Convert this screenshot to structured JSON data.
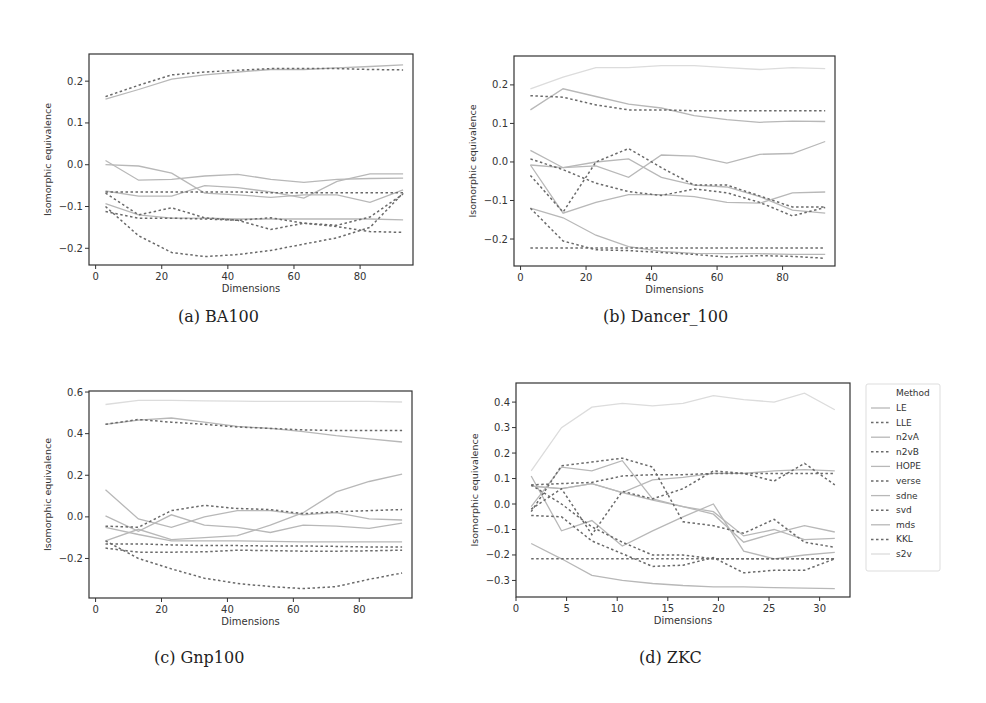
{
  "figure": {
    "subplots": [
      {
        "id": "a",
        "caption": "(a) BA100"
      },
      {
        "id": "b",
        "caption": "(b) Dancer_100"
      },
      {
        "id": "c",
        "caption": "(c) Gnp100"
      },
      {
        "id": "d",
        "caption": "(d) ZKC"
      }
    ],
    "legend": {
      "title": "Method",
      "entries": [
        {
          "label": "LE",
          "style": "solid"
        },
        {
          "label": "LLE",
          "style": "dashed"
        },
        {
          "label": "n2vA",
          "style": "solid"
        },
        {
          "label": "n2vB",
          "style": "dashed"
        },
        {
          "label": "HOPE",
          "style": "solid"
        },
        {
          "label": "verse",
          "style": "dashed"
        },
        {
          "label": "sdne",
          "style": "solid"
        },
        {
          "label": "svd",
          "style": "dashed"
        },
        {
          "label": "mds",
          "style": "solid"
        },
        {
          "label": "KKL",
          "style": "dashed"
        },
        {
          "label": "s2v",
          "style": "solid"
        }
      ]
    },
    "colors": {
      "solid_line": "#b8b8b8",
      "dashed_line": "#6a6a6a",
      "faint_line": "#dcdcdc",
      "axis": "#333333"
    }
  },
  "chart_data": [
    {
      "type": "line",
      "title": "(a) BA100",
      "xlabel": "Dimensions",
      "ylabel": "Isomorphic equivalence",
      "xlim": [
        -2,
        96
      ],
      "ylim": [
        -0.24,
        0.265
      ],
      "xticks": [
        0,
        20,
        40,
        60,
        80
      ],
      "yticks": [
        -0.2,
        -0.1,
        0.0,
        0.1,
        0.2
      ],
      "ytick_labels": [
        "−0.2",
        "−0.1",
        "0.0",
        "0.1",
        "0.2"
      ],
      "grid": false,
      "x": [
        3,
        13,
        23,
        33,
        43,
        53,
        63,
        73,
        83,
        93
      ],
      "series": [
        {
          "name": "s-top",
          "style": "solid",
          "values": [
            0.157,
            0.18,
            0.205,
            0.215,
            0.222,
            0.228,
            0.228,
            0.232,
            0.235,
            0.239
          ]
        },
        {
          "name": "d-top",
          "style": "dashed",
          "values": [
            0.163,
            0.19,
            0.215,
            0.222,
            0.226,
            0.23,
            0.23,
            0.23,
            0.228,
            0.227
          ]
        },
        {
          "name": "s1",
          "style": "solid",
          "values": [
            0.0,
            -0.003,
            -0.02,
            -0.068,
            -0.072,
            -0.078,
            -0.072,
            -0.072,
            -0.09,
            -0.06
          ]
        },
        {
          "name": "s2",
          "style": "solid",
          "values": [
            0.01,
            -0.037,
            -0.035,
            -0.027,
            -0.023,
            -0.035,
            -0.042,
            -0.035,
            -0.033,
            -0.032
          ]
        },
        {
          "name": "s3",
          "style": "solid",
          "values": [
            -0.063,
            -0.075,
            -0.075,
            -0.05,
            -0.055,
            -0.065,
            -0.08,
            -0.04,
            -0.022,
            -0.022
          ]
        },
        {
          "name": "s4",
          "style": "solid",
          "values": [
            -0.093,
            -0.12,
            -0.128,
            -0.128,
            -0.13,
            -0.13,
            -0.13,
            -0.13,
            -0.13,
            -0.132
          ]
        },
        {
          "name": "d1",
          "style": "dashed",
          "values": [
            -0.065,
            -0.065,
            -0.065,
            -0.065,
            -0.065,
            -0.067,
            -0.067,
            -0.067,
            -0.067,
            -0.067
          ]
        },
        {
          "name": "d2",
          "style": "dashed",
          "values": [
            -0.068,
            -0.12,
            -0.103,
            -0.127,
            -0.133,
            -0.155,
            -0.14,
            -0.145,
            -0.125,
            -0.07
          ]
        },
        {
          "name": "d3",
          "style": "dashed",
          "values": [
            -0.112,
            -0.128,
            -0.128,
            -0.13,
            -0.133,
            -0.127,
            -0.14,
            -0.148,
            -0.16,
            -0.162
          ]
        },
        {
          "name": "d4",
          "style": "dashed",
          "values": [
            -0.1,
            -0.17,
            -0.21,
            -0.22,
            -0.215,
            -0.205,
            -0.19,
            -0.175,
            -0.15,
            -0.068
          ]
        }
      ]
    },
    {
      "type": "line",
      "title": "(b) Dancer_100",
      "xlabel": "Dimensions",
      "ylabel": "Isomorphic equivalence",
      "xlim": [
        -2,
        96
      ],
      "ylim": [
        -0.27,
        0.275
      ],
      "xticks": [
        0,
        20,
        40,
        60,
        80
      ],
      "yticks": [
        -0.2,
        -0.1,
        0.0,
        0.1,
        0.2
      ],
      "ytick_labels": [
        "−0.2",
        "−0.1",
        "0.0",
        "0.1",
        "0.2"
      ],
      "grid": false,
      "x": [
        3,
        13,
        23,
        33,
        43,
        53,
        63,
        73,
        83,
        93
      ],
      "series": [
        {
          "name": "faint-top",
          "style": "faint",
          "values": [
            0.19,
            0.22,
            0.245,
            0.245,
            0.25,
            0.25,
            0.245,
            0.24,
            0.245,
            0.242
          ]
        },
        {
          "name": "s-top",
          "style": "solid",
          "values": [
            0.135,
            0.19,
            0.17,
            0.15,
            0.14,
            0.12,
            0.11,
            0.103,
            0.106,
            0.105
          ]
        },
        {
          "name": "d-top",
          "style": "dashed",
          "values": [
            0.172,
            0.168,
            0.148,
            0.135,
            0.135,
            0.133,
            0.133,
            0.133,
            0.133,
            0.133
          ]
        },
        {
          "name": "s1",
          "style": "solid",
          "values": [
            -0.008,
            -0.015,
            0.0,
            0.008,
            -0.04,
            -0.06,
            -0.065,
            -0.09,
            -0.125,
            -0.133
          ]
        },
        {
          "name": "s2",
          "style": "solid",
          "values": [
            0.03,
            -0.015,
            -0.01,
            -0.04,
            0.018,
            0.015,
            -0.003,
            0.02,
            0.022,
            0.053
          ]
        },
        {
          "name": "s3",
          "style": "solid",
          "values": [
            -0.008,
            -0.133,
            -0.105,
            -0.085,
            -0.085,
            -0.09,
            -0.105,
            -0.107,
            -0.08,
            -0.078
          ]
        },
        {
          "name": "s4",
          "style": "solid",
          "values": [
            -0.12,
            -0.145,
            -0.19,
            -0.22,
            -0.232,
            -0.237,
            -0.238,
            -0.238,
            -0.24,
            -0.24
          ]
        },
        {
          "name": "d1",
          "style": "dashed",
          "values": [
            0.008,
            -0.02,
            -0.055,
            -0.077,
            -0.087,
            -0.07,
            -0.08,
            -0.105,
            -0.14,
            -0.118
          ]
        },
        {
          "name": "d2",
          "style": "dashed",
          "values": [
            -0.035,
            -0.13,
            0.0,
            0.035,
            -0.015,
            -0.06,
            -0.06,
            -0.088,
            -0.117,
            -0.117
          ]
        },
        {
          "name": "d3",
          "style": "dashed",
          "values": [
            -0.12,
            -0.205,
            -0.228,
            -0.23,
            -0.235,
            -0.24,
            -0.247,
            -0.243,
            -0.245,
            -0.25
          ]
        },
        {
          "name": "d4",
          "style": "dashed",
          "values": [
            -0.223,
            -0.223,
            -0.223,
            -0.223,
            -0.223,
            -0.223,
            -0.223,
            -0.223,
            -0.223,
            -0.223
          ]
        }
      ]
    },
    {
      "type": "line",
      "title": "(c) Gnp100",
      "xlabel": "Dimensions",
      "ylabel": "Isomorphic equivalence",
      "xlim": [
        -2,
        96
      ],
      "ylim": [
        -0.39,
        0.605
      ],
      "xticks": [
        0,
        20,
        40,
        60,
        80
      ],
      "yticks": [
        -0.2,
        0.0,
        0.2,
        0.4,
        0.6
      ],
      "ytick_labels": [
        "−0.2",
        "0.0",
        "0.2",
        "0.4",
        "0.6"
      ],
      "grid": false,
      "x": [
        3,
        13,
        23,
        33,
        43,
        53,
        63,
        73,
        83,
        93
      ],
      "series": [
        {
          "name": "faint-top",
          "style": "faint",
          "values": [
            0.54,
            0.56,
            0.56,
            0.558,
            0.556,
            0.555,
            0.555,
            0.555,
            0.555,
            0.552
          ]
        },
        {
          "name": "s-top",
          "style": "solid",
          "values": [
            0.445,
            0.465,
            0.475,
            0.455,
            0.435,
            0.425,
            0.41,
            0.39,
            0.375,
            0.36
          ]
        },
        {
          "name": "d-top",
          "style": "dashed",
          "values": [
            0.445,
            0.468,
            0.455,
            0.445,
            0.432,
            0.425,
            0.418,
            0.415,
            0.415,
            0.415
          ]
        },
        {
          "name": "s1",
          "style": "solid",
          "values": [
            0.13,
            -0.01,
            -0.05,
            0.0,
            0.03,
            0.03,
            0.01,
            0.02,
            -0.01,
            -0.015
          ]
        },
        {
          "name": "s2",
          "style": "solid",
          "values": [
            0.005,
            -0.07,
            0.01,
            -0.04,
            -0.05,
            -0.075,
            -0.04,
            -0.045,
            -0.055,
            -0.03
          ]
        },
        {
          "name": "s3",
          "style": "solid",
          "values": [
            -0.115,
            -0.06,
            -0.11,
            -0.1,
            -0.09,
            -0.04,
            0.02,
            0.12,
            0.17,
            0.205
          ]
        },
        {
          "name": "s4",
          "style": "solid",
          "values": [
            -0.05,
            -0.085,
            -0.115,
            -0.115,
            -0.115,
            -0.118,
            -0.12,
            -0.12,
            -0.12,
            -0.12
          ]
        },
        {
          "name": "d1",
          "style": "dashed",
          "values": [
            -0.045,
            -0.05,
            0.03,
            0.055,
            0.04,
            0.035,
            0.015,
            0.025,
            0.03,
            0.035
          ]
        },
        {
          "name": "d2",
          "style": "dashed",
          "values": [
            -0.13,
            -0.13,
            -0.135,
            -0.138,
            -0.138,
            -0.14,
            -0.14,
            -0.142,
            -0.145,
            -0.145
          ]
        },
        {
          "name": "d3",
          "style": "dashed",
          "values": [
            -0.15,
            -0.17,
            -0.17,
            -0.168,
            -0.16,
            -0.162,
            -0.165,
            -0.165,
            -0.163,
            -0.16
          ]
        },
        {
          "name": "d4",
          "style": "dashed",
          "values": [
            -0.115,
            -0.2,
            -0.25,
            -0.295,
            -0.32,
            -0.335,
            -0.345,
            -0.335,
            -0.3,
            -0.27
          ]
        }
      ]
    },
    {
      "type": "line",
      "title": "(d) ZKC",
      "xlabel": "Dimensions",
      "ylabel": "Isomorphic equivalence",
      "xlim": [
        0,
        33
      ],
      "ylim": [
        -0.365,
        0.475
      ],
      "xticks": [
        0,
        5,
        10,
        15,
        20,
        25,
        30
      ],
      "yticks": [
        -0.3,
        -0.2,
        -0.1,
        0.0,
        0.1,
        0.2,
        0.3,
        0.4
      ],
      "ytick_labels": [
        "−0.3",
        "−0.2",
        "−0.1",
        "0.0",
        "0.1",
        "0.2",
        "0.3",
        "0.4"
      ],
      "grid": false,
      "legend": {
        "position": "outside-right",
        "title": "Method"
      },
      "x": [
        1.5,
        4.5,
        7.5,
        10.5,
        13.5,
        16.5,
        19.5,
        22.5,
        25.5,
        28.5,
        31.5
      ],
      "series": [
        {
          "name": "s2v",
          "style": "faint",
          "values": [
            0.13,
            0.3,
            0.38,
            0.395,
            0.385,
            0.395,
            0.425,
            0.41,
            0.4,
            0.435,
            0.37
          ]
        },
        {
          "name": "s1",
          "style": "solid",
          "values": [
            0.07,
            0.06,
            0.08,
            0.045,
            0.095,
            0.105,
            0.12,
            0.12,
            0.13,
            0.135,
            0.13
          ]
        },
        {
          "name": "s2",
          "style": "solid",
          "values": [
            0.11,
            -0.105,
            -0.065,
            -0.165,
            -0.105,
            -0.05,
            0.0,
            -0.185,
            -0.215,
            -0.2,
            -0.19
          ]
        },
        {
          "name": "s3",
          "style": "solid",
          "values": [
            -0.01,
            0.145,
            0.13,
            0.17,
            0.02,
            -0.01,
            -0.03,
            -0.125,
            -0.1,
            -0.14,
            -0.135
          ]
        },
        {
          "name": "s4",
          "style": "solid",
          "values": [
            0.07,
            0.06,
            0.08,
            0.045,
            0.015,
            -0.01,
            -0.04,
            -0.15,
            -0.115,
            -0.085,
            -0.11
          ]
        },
        {
          "name": "s5",
          "style": "solid",
          "values": [
            -0.155,
            -0.215,
            -0.28,
            -0.3,
            -0.312,
            -0.32,
            -0.325,
            -0.325,
            -0.328,
            -0.33,
            -0.332
          ]
        },
        {
          "name": "d1",
          "style": "dashed",
          "values": [
            -0.03,
            0.15,
            0.165,
            0.18,
            0.145,
            -0.07,
            -0.085,
            -0.115,
            -0.06,
            -0.15,
            -0.17
          ]
        },
        {
          "name": "d2",
          "style": "dashed",
          "values": [
            0.075,
            0.08,
            0.085,
            0.11,
            0.115,
            0.115,
            0.12,
            0.12,
            0.12,
            0.12,
            0.12
          ]
        },
        {
          "name": "d3",
          "style": "dashed",
          "values": [
            -0.02,
            0.06,
            -0.12,
            0.05,
            0.02,
            0.06,
            0.13,
            0.12,
            0.09,
            0.16,
            0.075
          ]
        },
        {
          "name": "d4",
          "style": "dashed",
          "values": [
            -0.045,
            -0.05,
            -0.145,
            -0.195,
            -0.245,
            -0.24,
            -0.21,
            -0.27,
            -0.26,
            -0.26,
            -0.215
          ]
        },
        {
          "name": "d5",
          "style": "dashed",
          "values": [
            0.075,
            0.0,
            -0.09,
            -0.15,
            -0.2,
            -0.2,
            -0.215,
            -0.215,
            -0.215,
            -0.215,
            -0.215
          ]
        },
        {
          "name": "d6",
          "style": "dashed",
          "values": [
            -0.215,
            -0.215,
            -0.215,
            -0.215,
            -0.215,
            -0.215,
            -0.215,
            -0.215,
            -0.215,
            -0.215,
            -0.215
          ]
        }
      ]
    }
  ]
}
